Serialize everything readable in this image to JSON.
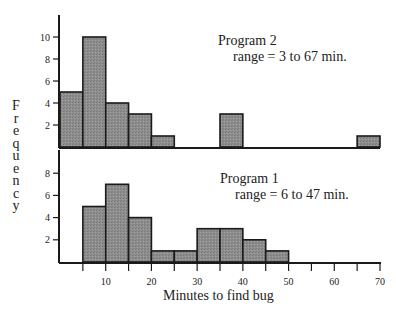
{
  "chart_data": [
    {
      "type": "bar",
      "title": "Program 2",
      "annotation": "range = 3 to 67 min.",
      "bin_width": 5,
      "bins": [
        {
          "start": 0,
          "end": 5,
          "value": 5
        },
        {
          "start": 5,
          "end": 10,
          "value": 10
        },
        {
          "start": 10,
          "end": 15,
          "value": 4
        },
        {
          "start": 15,
          "end": 20,
          "value": 3
        },
        {
          "start": 20,
          "end": 25,
          "value": 1
        },
        {
          "start": 35,
          "end": 40,
          "value": 3
        },
        {
          "start": 65,
          "end": 70,
          "value": 1
        }
      ],
      "yticks": [
        2,
        4,
        6,
        8,
        10
      ],
      "ylim": [
        0,
        12
      ],
      "xlim": [
        0,
        70
      ]
    },
    {
      "type": "bar",
      "title": "Program 1",
      "annotation": "range = 6 to 47 min.",
      "bin_width": 5,
      "bins": [
        {
          "start": 5,
          "end": 10,
          "value": 5
        },
        {
          "start": 10,
          "end": 15,
          "value": 7
        },
        {
          "start": 15,
          "end": 20,
          "value": 4
        },
        {
          "start": 20,
          "end": 25,
          "value": 1
        },
        {
          "start": 25,
          "end": 30,
          "value": 1
        },
        {
          "start": 30,
          "end": 35,
          "value": 3
        },
        {
          "start": 35,
          "end": 40,
          "value": 3
        },
        {
          "start": 40,
          "end": 45,
          "value": 2
        },
        {
          "start": 45,
          "end": 50,
          "value": 1
        }
      ],
      "yticks": [
        2,
        4,
        6,
        8
      ],
      "ylim": [
        0,
        10
      ],
      "xlim": [
        0,
        70
      ]
    }
  ],
  "axes": {
    "ylabel": "Frequency",
    "xlabel": "Minutes to find bug",
    "xticks": [
      10,
      20,
      30,
      40,
      50,
      60,
      70
    ]
  },
  "labels": {
    "top_title": "Program 2",
    "top_range": "range = 3 to 67 min.",
    "bottom_title": "Program 1",
    "bottom_range": "range = 6 to 47 min.",
    "xlabel": "Minutes to find bug"
  },
  "colors": {
    "bar_fill": "#8c8c8c",
    "bar_stroke": "#1a1a1a",
    "axis": "#1a1a1a"
  }
}
